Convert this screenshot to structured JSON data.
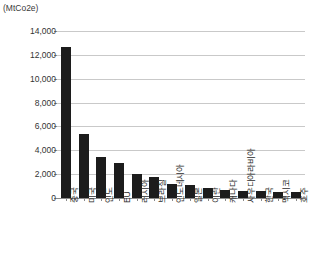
{
  "unit_label": "(MtCo2e)",
  "chart_data": {
    "type": "bar",
    "title": "",
    "subtitle": "",
    "xlabel": "",
    "ylabel": "(MtCo2e)",
    "ylim": [
      0,
      14000
    ],
    "ytick_values": [
      0,
      2000,
      4000,
      6000,
      8000,
      10000,
      12000,
      14000
    ],
    "ytick_labels": [
      "0",
      "2,000",
      "4,000",
      "6,000",
      "8,000",
      "10,000",
      "12,000",
      "14,000"
    ],
    "grid": true,
    "legend": false,
    "bar_color": "#1c1c1c",
    "categories": [
      "중국",
      "미국",
      "인도",
      "EU",
      "러시아",
      "브라질",
      "인도네시아",
      "일본",
      "이란",
      "캐나다",
      "사우디아라비아",
      "한국",
      "멕시코",
      "호주"
    ],
    "values": [
      12700,
      5400,
      3400,
      2900,
      2000,
      1800,
      1150,
      1080,
      800,
      700,
      620,
      580,
      500,
      480
    ]
  }
}
